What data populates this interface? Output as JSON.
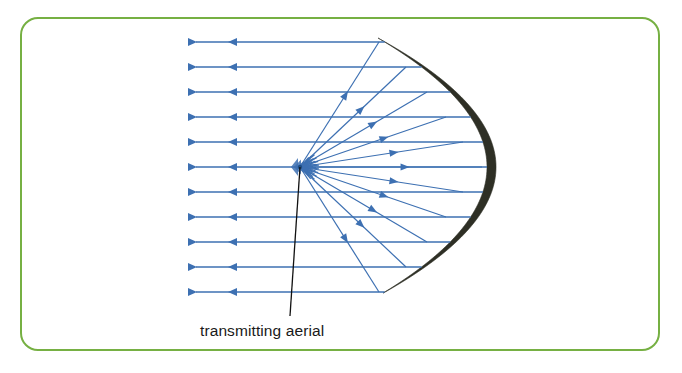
{
  "figure": {
    "frame": {
      "border_color": "#76b043",
      "background_color": "#ffffff",
      "x": 20,
      "y": 17,
      "width": 640,
      "height": 334,
      "corner_radius": 18
    },
    "label": {
      "text": "transmitting aerial",
      "x": 200,
      "y": 336,
      "color": "#1a1a1a"
    },
    "leader_line": {
      "name": "aerial-leader-line",
      "color": "#111111",
      "from_x": 300,
      "from_y": 167,
      "to_x": 290,
      "to_y": 316
    }
  },
  "chart_data": {
    "type": "diagram",
    "subject": "transmitting aerial",
    "colors": {
      "ray": "#3d70b2",
      "reflector": "#2e2f25",
      "frame": "#76b043",
      "leader": "#111111",
      "text": "#1a1a1a"
    },
    "focus": {
      "x": 300,
      "y": 167,
      "label": "transmitting aerial"
    },
    "reflector": {
      "shape": "parabolic crescent",
      "vertex_x": 487,
      "vertex_y": 167,
      "top_tip": {
        "x": 378,
        "y": 38
      },
      "bottom_tip": {
        "x": 378,
        "y": 293
      },
      "thickness_px": 9,
      "fill": "#2e2f25"
    },
    "parallel_rays": {
      "count": 11,
      "direction": "leftward",
      "start_x": 196,
      "y_values": [
        42,
        67,
        92,
        117,
        142,
        167,
        192,
        217,
        242,
        267,
        292
      ],
      "arrow_x": 228,
      "note": "reflected rays leave the dish parallel to the axis"
    },
    "radial_rays": {
      "count": 11,
      "origin": {
        "x": 300,
        "y": 167
      },
      "endpoints_on_reflector": [
        {
          "x": 379,
          "y": 42
        },
        {
          "x": 406,
          "y": 67
        },
        {
          "x": 427,
          "y": 92
        },
        {
          "x": 446,
          "y": 117
        },
        {
          "x": 463,
          "y": 142
        },
        {
          "x": 482,
          "y": 167
        },
        {
          "x": 463,
          "y": 192
        },
        {
          "x": 446,
          "y": 217
        },
        {
          "x": 427,
          "y": 242
        },
        {
          "x": 406,
          "y": 267
        },
        {
          "x": 379,
          "y": 292
        }
      ],
      "note": "rays emitted from the aerial at the focus strike the reflector"
    }
  }
}
